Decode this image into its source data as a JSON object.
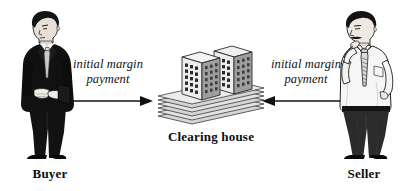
{
  "diagram": {
    "type": "flow-diagram",
    "background_color": "#ffffff",
    "ink_color": "#101010",
    "title_visible": false
  },
  "parties": {
    "left": {
      "label": "Buyer",
      "figure_name": "businessman-dark-suit",
      "description_visible": false
    },
    "right": {
      "label": "Seller",
      "figure_name": "businessman-white-shirt",
      "description_visible": false
    }
  },
  "center": {
    "label": "Clearing house",
    "figure_name": "office-towers-on-stacked-base",
    "tower_count": 2,
    "base_layer_count": 6,
    "window_rows": 7,
    "window_cols": 3
  },
  "flows": [
    {
      "id": "buyer-to-clearinghouse",
      "line1": "initial margin",
      "line2": "payment",
      "direction": "right",
      "from": "Buyer",
      "to": "Clearing house"
    },
    {
      "id": "seller-to-clearinghouse",
      "line1": "initial margin",
      "line2": "payment",
      "direction": "left",
      "from": "Seller",
      "to": "Clearing house"
    }
  ],
  "colors": {
    "ink": "#101010",
    "suit_dark": "#111111",
    "shirt_light": "#f4f4f4",
    "tie_light": "#c9c9c9",
    "skin": "#e8e0d8",
    "building_fill": "#e9e9e9",
    "building_shade": "#bdbdbd",
    "building_dark": "#6e6e6e",
    "base_fill": "#dcdcdc"
  }
}
